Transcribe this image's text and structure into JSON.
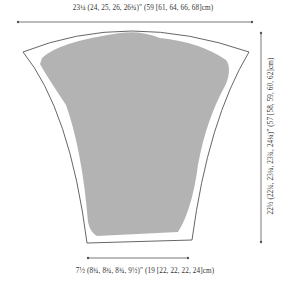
{
  "diagram": {
    "type": "knitting-schematic",
    "measurements": {
      "top_width": "23¼ (24, 25, 26, 26¾)\" (59 [61, 64, 66, 68]cm)",
      "side_length": "22½ (22¾, 23¼, 23¾, 24¼)\" (57 [58, 59, 60, 62]cm)",
      "bottom_width": "7½ (8¾, 8¾, 8¾, 9½)\" (19 [22, 22, 22, 24]cm)"
    },
    "colors": {
      "fill": "#b3b3b3",
      "outline": "#555555",
      "line": "#555555",
      "background": "#ffffff"
    }
  }
}
